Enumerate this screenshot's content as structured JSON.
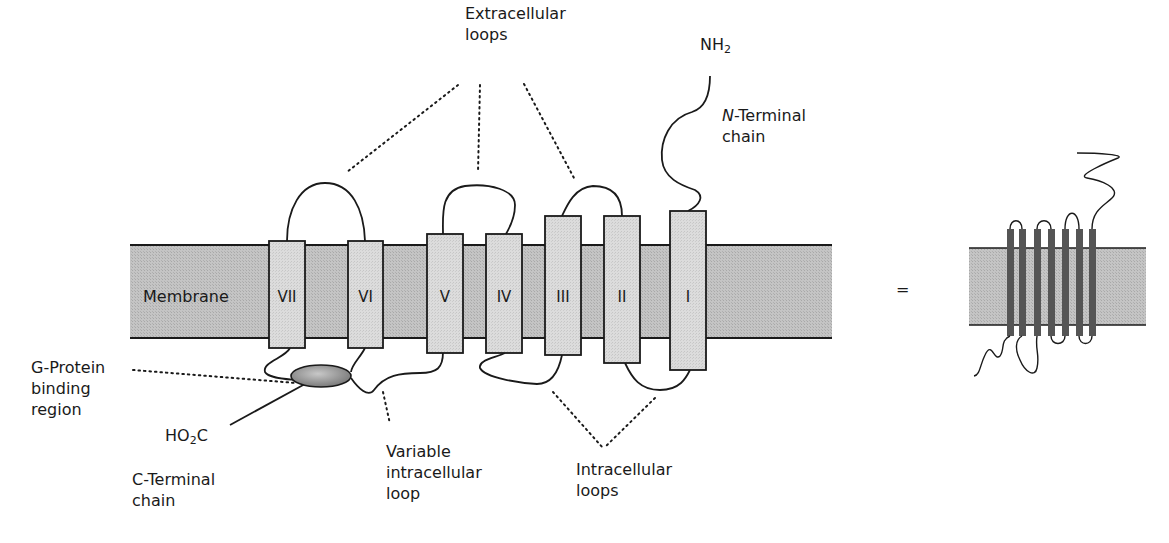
{
  "diagram": {
    "colors": {
      "membrane_fill": "#bdbdbd",
      "helix_fill": "#d6d6d6",
      "stroke": "#1a1a1a",
      "binding_region_fill": "#9a9a9a",
      "schematic_helix_fill": "#555555"
    },
    "membrane": {
      "label": "Membrane"
    },
    "helices": [
      {
        "id": "VII",
        "label": "VII"
      },
      {
        "id": "VI",
        "label": "VI"
      },
      {
        "id": "V",
        "label": "V"
      },
      {
        "id": "IV",
        "label": "IV"
      },
      {
        "id": "III",
        "label": "III"
      },
      {
        "id": "II",
        "label": "II"
      },
      {
        "id": "I",
        "label": "I"
      }
    ],
    "labels": {
      "extracellular_loops": [
        "Extracellular",
        "loops"
      ],
      "nh2_prefix": "NH",
      "nh2_sub": "2",
      "n_terminal_italic": "N",
      "n_terminal_rest": "-Terminal",
      "n_terminal_line2": "chain",
      "g_protein": [
        "G-Protein",
        "binding",
        "region"
      ],
      "ho2c_prefix": "HO",
      "ho2c_sub": "2",
      "ho2c_suffix": "C",
      "c_terminal": [
        "C-Terminal",
        "chain"
      ],
      "variable_loop": [
        "Variable",
        "intracellular",
        "loop"
      ],
      "intracellular_loops": [
        "Intracellular",
        "loops"
      ],
      "equals": "="
    }
  }
}
